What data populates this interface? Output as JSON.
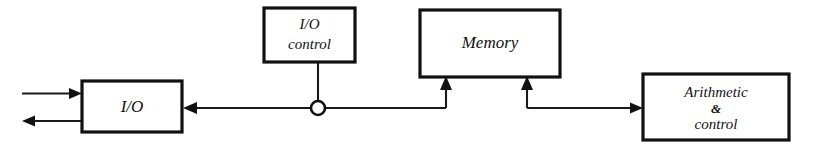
{
  "diagram": {
    "type": "block-diagram",
    "style": "hand-drawn",
    "background_color": "#ffffff",
    "line_color": "#111111",
    "nodes": [
      {
        "id": "io",
        "label": "I/O",
        "lines": [
          "I/O"
        ],
        "x": 82,
        "y": 81,
        "w": 100,
        "h": 51
      },
      {
        "id": "io-control",
        "label": "I/O control",
        "lines": [
          "I/O",
          "control"
        ],
        "x": 264,
        "y": 8,
        "w": 91,
        "h": 54
      },
      {
        "id": "memory",
        "label": "Memory",
        "lines": [
          "Memory"
        ],
        "x": 420,
        "y": 10,
        "w": 140,
        "h": 67
      },
      {
        "id": "arithmetic-control",
        "label": "Arithmetic & control",
        "lines": [
          "Arithmetic",
          "&",
          "control"
        ],
        "x": 643,
        "y": 74,
        "w": 146,
        "h": 66
      }
    ],
    "connections": [
      {
        "id": "external-input-to-io",
        "from": "external",
        "to": "io",
        "direction": "right",
        "arrow": true
      },
      {
        "id": "io-to-external-output",
        "from": "io",
        "to": "external",
        "direction": "left",
        "arrow": true
      },
      {
        "id": "bus-to-io",
        "from": "bus",
        "to": "io",
        "direction": "left",
        "arrow": true
      },
      {
        "id": "io-control-to-bus",
        "from": "io-control",
        "to": "bus",
        "direction": "down",
        "arrow": false
      },
      {
        "id": "bus-to-memory-left",
        "from": "bus",
        "to": "memory",
        "direction": "up",
        "arrow": true
      },
      {
        "id": "memory-to-arithmetic",
        "from": "memory",
        "to": "arithmetic-control",
        "direction": "right",
        "arrow": true
      }
    ],
    "junctions": [
      {
        "id": "bus-junction",
        "shape": "open-circle",
        "cx": 318,
        "cy": 108,
        "r": 7
      }
    ]
  }
}
